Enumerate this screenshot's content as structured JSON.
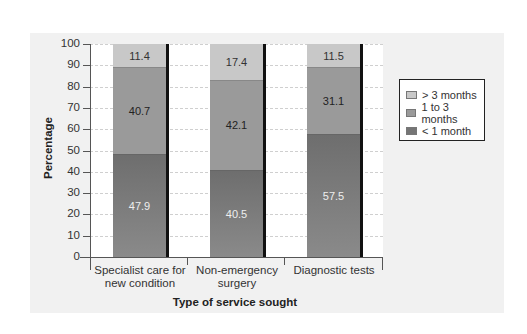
{
  "chart_data": {
    "type": "bar",
    "stacked": true,
    "title": "",
    "xlabel": "Type of service sought",
    "ylabel": "Percentage",
    "ylim": [
      0,
      100
    ],
    "yticks": [
      0,
      10,
      20,
      30,
      40,
      50,
      60,
      70,
      80,
      90,
      100
    ],
    "categories": [
      "Specialist care for new condition",
      "Non-emergency surgery",
      "Diagnostic tests"
    ],
    "category_lines": [
      [
        "Specialist care for",
        "new condition"
      ],
      [
        "Non-emergency",
        "surgery"
      ],
      [
        "Diagnostic tests",
        ""
      ]
    ],
    "series": [
      {
        "name": "< 1 month",
        "values": [
          47.9,
          40.5,
          57.5
        ],
        "color": "#7a7a7a"
      },
      {
        "name": "1 to 3 months",
        "values": [
          40.7,
          42.1,
          31.1
        ],
        "color": "#9a9a9a"
      },
      {
        "name": "> 3 months",
        "values": [
          11.4,
          17.4,
          11.5
        ],
        "color": "#c8c8c8"
      }
    ],
    "legend": {
      "position": "right",
      "entries": [
        "> 3 months",
        "1 to 3 months",
        "< 1 month"
      ]
    },
    "grid": true
  }
}
